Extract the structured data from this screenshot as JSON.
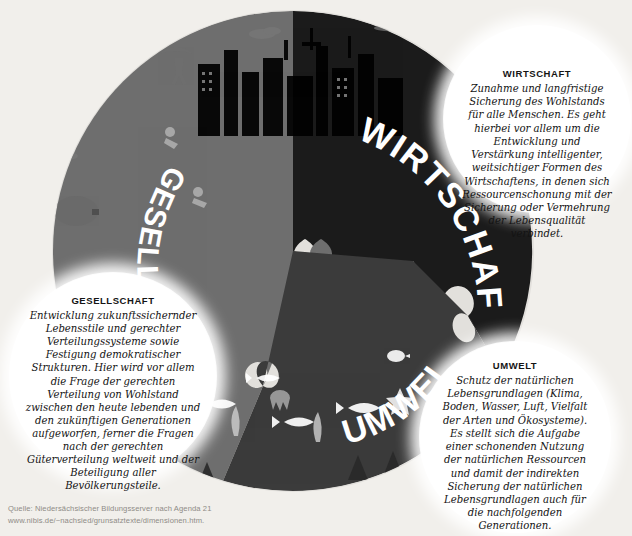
{
  "background_color": "#f1efeb",
  "puzzle": {
    "pieces": [
      {
        "id": "wirtschaft",
        "label": "WIRTSCHAFT",
        "color": "#1b1b1b"
      },
      {
        "id": "gesellschaft",
        "label": "GESELLSCHAFT",
        "color": "#6e6e6e"
      },
      {
        "id": "umwelt",
        "label": "UMWELT",
        "color": "#3b3b3b"
      }
    ],
    "label_color": "#ffffff"
  },
  "callouts": {
    "wirtschaft": {
      "title": "WIRTSCHAFT",
      "body": "Zunahme und langfristige Sicherung des Wohlstands für alle Menschen. Es geht hierbei vor allem um die Entwicklung und Verstärkung intelligenter, weitsichtiger Formen des Wirtschaftens, in denen sich Ressourcenschonung mit der Sicherung oder Vermehrung der Lebensqualität verbindet."
    },
    "gesellschaft": {
      "title": "GESELLSCHAFT",
      "body": "Entwicklung zukunftssichernder Lebensstile und gerechter Verteilungssysteme sowie Festigung demokratischer Strukturen. Hier wird vor allem die Frage der gerechten Verteilung von Wohlstand zwischen den heute lebenden und den zukünftigen Generationen aufgeworfen, ferner die Fragen nach der gerechten Güterverteilung weltweit und der Beteiligung aller Bevölkerungsteile."
    },
    "umwelt": {
      "title": "UMWELT",
      "body": "Schutz der natürlichen Lebensgrundlagen (Klima, Boden, Wasser, Luft, Vielfalt der Arten und Ökosysteme). Es stellt sich die Aufgabe einer schonenden Nutzung der natürlichen Ressourcen und damit der indirekten Sicherung der natürlichen Lebensgrundlagen auch für die nachfolgenden Generationen."
    }
  },
  "source": {
    "line1": "Quelle: Niedersächsischer Bildungsserver nach Agenda 21",
    "line2": "www.nibis.de/~nachsied/grunsatztexte/dimensionen.htm."
  }
}
